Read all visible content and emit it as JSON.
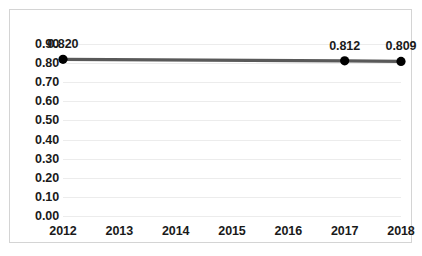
{
  "chart_data": {
    "type": "line",
    "title": "",
    "xlabel": "",
    "ylabel": "",
    "categories": [
      "2012",
      "2013",
      "2014",
      "2015",
      "2016",
      "2017",
      "2018"
    ],
    "x": [
      2012,
      2013,
      2014,
      2015,
      2016,
      2017,
      2018
    ],
    "series": [
      {
        "name": "",
        "values": [
          0.82,
          null,
          null,
          null,
          null,
          0.812,
          0.809
        ],
        "point_labels": [
          "0.820",
          null,
          null,
          null,
          null,
          "0.812",
          "0.809"
        ],
        "line_color": "#595959",
        "marker_color": "#000000"
      }
    ],
    "ylim": [
      0.0,
      0.9
    ],
    "ytick_values": [
      0.9,
      0.8,
      0.7,
      0.6,
      0.5,
      0.4,
      0.3,
      0.2,
      0.1,
      0.0
    ],
    "ytick_labels": [
      "0.90",
      "0.80",
      "0.70",
      "0.60",
      "0.50",
      "0.40",
      "0.30",
      "0.20",
      "0.10",
      "0.00"
    ],
    "grid": true,
    "grid_color": "#ececec",
    "legend": false,
    "legend_position": "none",
    "border_color": "#d4d4d4",
    "background": "#ffffff"
  }
}
